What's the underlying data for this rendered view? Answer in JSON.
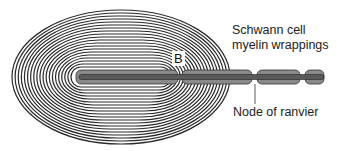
{
  "labels": {
    "schwann_line1": "Schwann cell",
    "schwann_line2": "myelin wrappings",
    "node": "Node of ranvier",
    "b": "B"
  },
  "colors": {
    "ring": "#2a2a2a",
    "axon_fill": "#8a8a8a",
    "axon_core": "#5a5a5a",
    "background": "#ffffff"
  },
  "rings": {
    "count": 20,
    "cx": 121,
    "cy": 77,
    "rx_outer": 109,
    "ry_outer": 67,
    "rx_inner": 50,
    "ry_inner": 10
  },
  "axon": {
    "y_top": 70,
    "y_bottom": 84,
    "segments": [
      {
        "x1": 76,
        "x2": 178
      },
      {
        "x1": 182,
        "x2": 252
      },
      {
        "x1": 257,
        "x2": 300
      },
      {
        "x1": 305,
        "x2": 324
      }
    ]
  },
  "node_pointer": {
    "x": 255,
    "y1": 84,
    "y2": 104
  }
}
